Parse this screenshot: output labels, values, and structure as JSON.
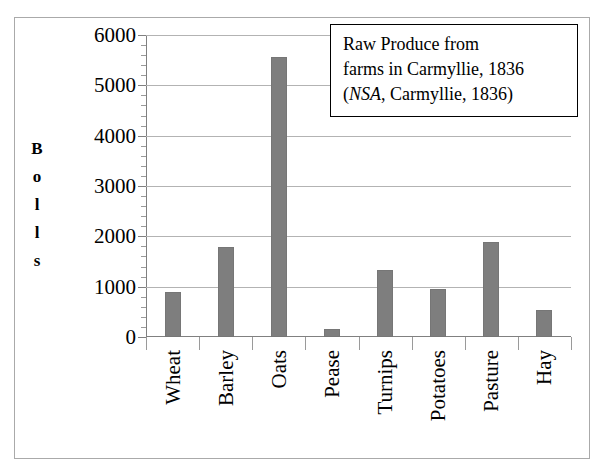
{
  "chart_data": {
    "type": "bar",
    "title": "",
    "xlabel": "",
    "ylabel": "Bolls",
    "ylabel_letters": [
      "B",
      "o",
      "l",
      "l",
      "s"
    ],
    "categories": [
      "Wheat",
      "Barley",
      "Oats",
      "Pease",
      "Turnips",
      "Potatoes",
      "Pasture",
      "Hay"
    ],
    "values": [
      900,
      1780,
      5570,
      160,
      1340,
      950,
      1880,
      540
    ],
    "ylim": [
      0,
      6000
    ],
    "ytick_labels": [
      "0",
      "1000",
      "2000",
      "3000",
      "4000",
      "5000",
      "6000"
    ],
    "ytick_values": [
      0,
      1000,
      2000,
      3000,
      4000,
      5000,
      6000
    ],
    "minor_tick_interval": 200,
    "grid": true,
    "legend": false,
    "bar_color": "#7e7e7e",
    "gridline_color": "#b3b3b3",
    "axis_color": "#808080",
    "frame_color": "#aaaaaa"
  },
  "annotation": {
    "line1": "Raw Produce from",
    "line2": "farms in Carmyllie, 1836",
    "line3_prefix": "(",
    "line3_italic": "NSA",
    "line3_suffix": ", Carmyllie, 1836)"
  }
}
